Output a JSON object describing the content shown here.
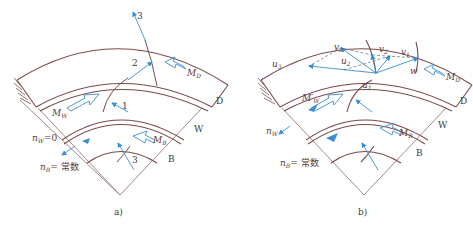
{
  "figure": {
    "panel_a": {
      "caption": "a)",
      "labels": {
        "stream_1": "1",
        "stream_2": "2",
        "stream_3_top": "3",
        "stream_3_bottom": "3",
        "m_d": "M",
        "m_d_sub": "D",
        "m_w": "M",
        "m_w_sub": "W",
        "m_b": "M",
        "m_b_sub": "B",
        "ring_d": "D",
        "ring_w": "W",
        "ring_b": "B",
        "n_w": "n",
        "n_w_sub": "W",
        "n_w_val": "=0",
        "n_b": "n",
        "n_b_sub": "B",
        "n_b_val": "= 常数"
      }
    },
    "panel_b": {
      "caption": "b)",
      "labels": {
        "v1": "v",
        "v1_sub": "1",
        "v2": "v",
        "v2_sub": "2",
        "v3": "v",
        "v3_sub": "3",
        "u1": "u",
        "u1_sub": "1",
        "u2": "u",
        "u2_sub": "2",
        "u3": "u",
        "u3_sub": "3",
        "w": "w",
        "m_d": "M",
        "m_d_sub": "D",
        "m_w": "M′",
        "m_w_sub": "W",
        "m_b": "M",
        "m_b_sub": "B",
        "ring_d": "D",
        "ring_w": "W",
        "ring_b": "B",
        "n_w": "n",
        "n_w_sub": "W",
        "n_b": "n",
        "n_b_sub": "B",
        "n_b_val": "= 常数"
      }
    },
    "colors": {
      "outline": "#7a4a4a",
      "flow": "#3a8fd0",
      "text": "#5a3a3a"
    }
  }
}
